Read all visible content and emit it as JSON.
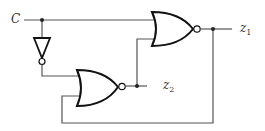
{
  "diagram": {
    "type": "logic-circuit",
    "input": {
      "label": "C"
    },
    "outputs": [
      {
        "id": "z1",
        "base": "z",
        "sub": "1"
      },
      {
        "id": "z2",
        "base": "z",
        "sub": "2"
      }
    ],
    "gates": [
      {
        "id": "nor-top",
        "type": "NOR",
        "inputs": [
          "C",
          "z2"
        ],
        "output": "z1"
      },
      {
        "id": "not",
        "type": "NOT",
        "inputs": [
          "C"
        ],
        "output": "C'"
      },
      {
        "id": "nor-bottom",
        "type": "NOR",
        "inputs": [
          "C'",
          "z1"
        ],
        "output": "z2"
      }
    ],
    "colors": {
      "wire": "#555555",
      "gate": "#111111"
    }
  }
}
